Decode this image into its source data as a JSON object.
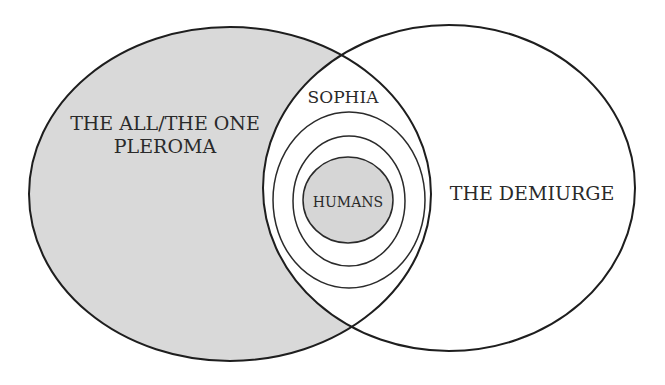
{
  "diagram": {
    "type": "venn",
    "colors": {
      "background": "#ffffff",
      "pleroma_fill": "#d9d9d9",
      "humans_fill": "#d6d6d6",
      "stroke": "#1e1e1e",
      "text": "#2a2a2a"
    },
    "regions": {
      "left": {
        "line1": "THE ALL/THE ONE",
        "line2": "PLEROMA"
      },
      "right": {
        "label": "THE DEMIURGE"
      },
      "overlap": {
        "label": "SOPHIA"
      },
      "center": {
        "label": "HUMANS"
      }
    }
  }
}
